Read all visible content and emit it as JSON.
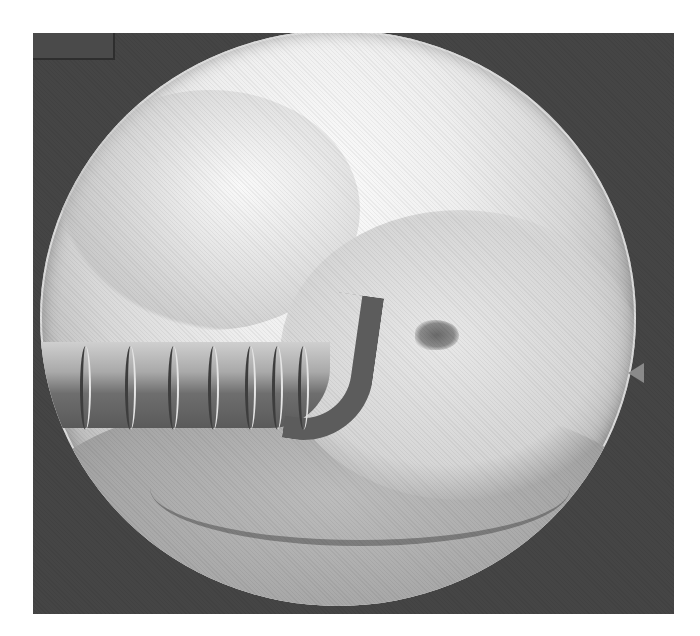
{
  "image": {
    "kind": "arthroscopic endoscopic view",
    "color_mode": "grayscale",
    "width": 700,
    "height": 636
  },
  "overlay": {
    "label_box_text": "",
    "field_of_view_shape": "circle",
    "orientation_notch": "right edge"
  },
  "scene": {
    "instrument": "arthroscopic probe with graduated markings",
    "probe_marking_count": 7,
    "finding": "small dark cartilage lesion on articular surface",
    "colors": {
      "background_frame": "#454545",
      "view_bright": "#fbfbfb",
      "view_edge": "#a0a0a0",
      "instrument_dark": "#5a5a5a"
    }
  }
}
